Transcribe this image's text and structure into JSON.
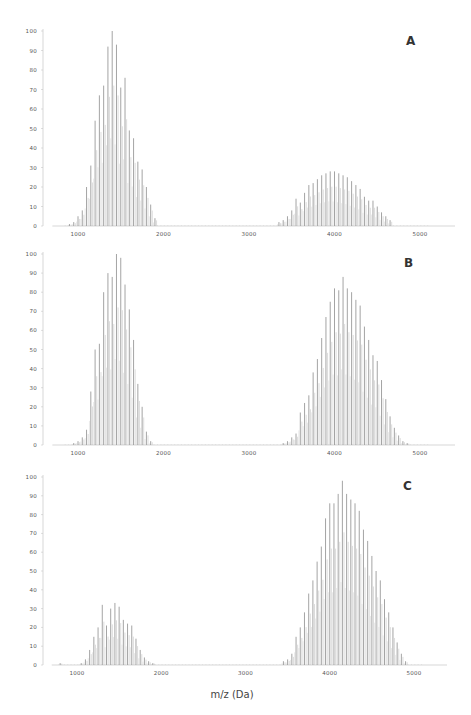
{
  "chart_data": {
    "type": "bar",
    "subtype": "mass-spectrum-stick",
    "xlabel": "m/z (Da)",
    "ylabel": "",
    "shared_x_axis_label": "m/z (Da)",
    "panels": [
      {
        "label": "A",
        "xlim": [
          700,
          5400
        ],
        "ylim": [
          0,
          100
        ],
        "x_ticks": [
          1000,
          2000,
          3000,
          4000,
          5000
        ],
        "y_ticks": [
          0,
          10,
          20,
          30,
          40,
          50,
          60,
          70,
          80,
          90,
          100
        ],
        "grid": false,
        "series": [
          {
            "name": "low-mass envelope",
            "x": [
              900,
              950,
              1000,
              1050,
              1100,
              1150,
              1200,
              1250,
              1300,
              1350,
              1400,
              1450,
              1500,
              1550,
              1600,
              1650,
              1700,
              1750,
              1800,
              1850,
              1900
            ],
            "values": [
              1,
              2,
              5,
              8,
              20,
              31,
              54,
              67,
              72,
              92,
              100,
              93,
              71,
              76,
              49,
              45,
              33,
              29,
              20,
              11,
              4
            ]
          },
          {
            "name": "high-mass envelope",
            "x": [
              3350,
              3400,
              3450,
              3500,
              3550,
              3600,
              3650,
              3700,
              3750,
              3800,
              3850,
              3900,
              3950,
              4000,
              4050,
              4100,
              4150,
              4200,
              4250,
              4300,
              4350,
              4400,
              4450,
              4500,
              4550,
              4600,
              4650
            ],
            "values": [
              2,
              3,
              5,
              8,
              14,
              12,
              17,
              21,
              22,
              24,
              26,
              27,
              28,
              28,
              27,
              26,
              25,
              23,
              21,
              19,
              15,
              13,
              13,
              10,
              7,
              5,
              3
            ]
          }
        ]
      },
      {
        "label": "B",
        "xlim": [
          700,
          5400
        ],
        "ylim": [
          0,
          100
        ],
        "x_ticks": [
          1000,
          2000,
          3000,
          4000,
          5000
        ],
        "y_ticks": [
          0,
          10,
          20,
          30,
          40,
          50,
          60,
          70,
          80,
          90,
          100
        ],
        "grid": false,
        "series": [
          {
            "name": "low-mass envelope",
            "x": [
              950,
              1000,
              1050,
              1100,
              1150,
              1200,
              1250,
              1300,
              1350,
              1400,
              1450,
              1500,
              1550,
              1600,
              1650,
              1700,
              1750,
              1800,
              1850
            ],
            "values": [
              1,
              2,
              4,
              8,
              28,
              50,
              53,
              80,
              90,
              88,
              100,
              98,
              84,
              71,
              55,
              32,
              20,
              7,
              2
            ]
          },
          {
            "name": "high-mass envelope",
            "x": [
              3400,
              3450,
              3500,
              3550,
              3600,
              3650,
              3700,
              3750,
              3800,
              3850,
              3900,
              3950,
              4000,
              4050,
              4100,
              4150,
              4200,
              4250,
              4300,
              4350,
              4400,
              4450,
              4500,
              4550,
              4600,
              4650,
              4700,
              4750,
              4800,
              4850
            ],
            "values": [
              1,
              2,
              4,
              6,
              17,
              22,
              26,
              38,
              45,
              56,
              67,
              75,
              82,
              81,
              88,
              82,
              80,
              76,
              73,
              62,
              55,
              47,
              44,
              34,
              24,
              15,
              9,
              5,
              2,
              1
            ]
          }
        ]
      },
      {
        "label": "C",
        "xlim": [
          700,
          5400
        ],
        "ylim": [
          0,
          100
        ],
        "x_ticks": [
          1000,
          2000,
          3000,
          4000,
          5000
        ],
        "y_ticks": [
          0,
          10,
          20,
          30,
          40,
          50,
          60,
          70,
          80,
          90,
          100
        ],
        "grid": false,
        "series": [
          {
            "name": "low-mass envelope",
            "x": [
              800,
              1050,
              1100,
              1150,
              1200,
              1250,
              1300,
              1350,
              1400,
              1450,
              1500,
              1550,
              1600,
              1650,
              1700,
              1750,
              1800,
              1850,
              1900
            ],
            "values": [
              1,
              1,
              3,
              8,
              15,
              20,
              32,
              21,
              30,
              33,
              31,
              24,
              22,
              21,
              14,
              8,
              4,
              2,
              1
            ]
          },
          {
            "name": "high-mass envelope",
            "x": [
              3450,
              3500,
              3550,
              3600,
              3650,
              3700,
              3750,
              3800,
              3850,
              3900,
              3950,
              4000,
              4050,
              4100,
              4150,
              4200,
              4250,
              4300,
              4350,
              4400,
              4450,
              4500,
              4550,
              4600,
              4650,
              4700,
              4750,
              4800,
              4850,
              4900
            ],
            "values": [
              2,
              3,
              6,
              15,
              20,
              28,
              38,
              45,
              55,
              63,
              78,
              86,
              86,
              91,
              98,
              91,
              88,
              86,
              82,
              72,
              66,
              58,
              50,
              45,
              35,
              28,
              20,
              12,
              6,
              2
            ]
          }
        ]
      }
    ]
  },
  "figure": {
    "panel_labels": [
      "A",
      "B",
      "C"
    ],
    "x_axis_title": "m/z (Da)",
    "stick_color": "#9a9a9a",
    "axis_color": "#bdbdbd",
    "label_color": "#333333"
  }
}
